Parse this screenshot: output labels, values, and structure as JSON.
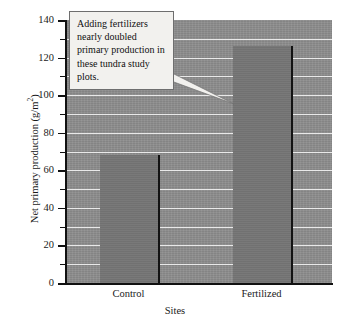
{
  "chart_data": {
    "type": "bar",
    "title": "",
    "categories": [
      "Control",
      "Fertilized"
    ],
    "values": [
      68,
      126
    ],
    "series": [
      {
        "name": "Net primary production",
        "values": [
          68,
          126
        ]
      }
    ],
    "xlabel": "Sites",
    "ylabel": "Net primary production (g/m2)",
    "ylabel_base": "Net primary production (g/m",
    "ylabel_exponent": "2",
    "ylabel_tail": ")",
    "ylim": [
      0,
      140
    ],
    "ytick_major": [
      0,
      20,
      40,
      60,
      80,
      100,
      120,
      140
    ],
    "ytick_minor": [
      10,
      30,
      50,
      70,
      90,
      110,
      130
    ],
    "ytick_labels": [
      "0",
      "20",
      "40",
      "60",
      "80",
      "100",
      "120",
      "140"
    ],
    "grid": "horizontal gridlines every 10 units",
    "legend": "none",
    "annotations": [
      {
        "text": "Adding fertilizers nearly doubled primary production in these tundra study plots.",
        "points_to": "Fertilized"
      }
    ],
    "colors": {
      "plot_background": "#8d8d8d",
      "bar_fill": "#757575",
      "bar_edge": "#121212",
      "gridline": "#e9e9e9",
      "axis": "#111111",
      "callout_background": "#f2f1ee",
      "callout_border": "#6e6e6e",
      "page_background": "#ffffff"
    }
  },
  "callout": {
    "text": "Adding fertilizers nearly doubled primary production in these tundra study plots."
  }
}
